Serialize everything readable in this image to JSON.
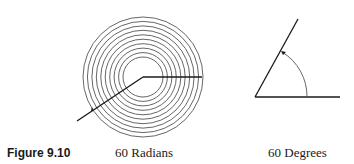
{
  "figure": {
    "caption": "Figure 9.10",
    "panels": [
      {
        "id": "radians",
        "label": "60 Radians",
        "rings": 10,
        "center": [
          143,
          77
        ],
        "inner_radius": 20,
        "outer_radius": 60
      },
      {
        "id": "degrees",
        "label": "60 Degrees",
        "vertex": [
          255,
          97
        ],
        "angle_deg": 60
      }
    ],
    "colors": {
      "line": "#1a1a1a",
      "ring": "#555555"
    }
  }
}
